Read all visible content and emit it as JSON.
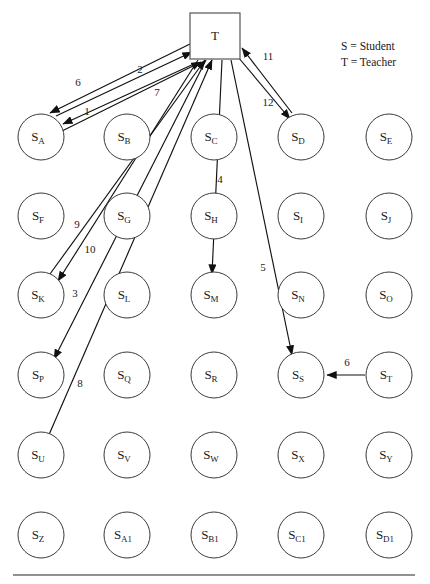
{
  "diagram": {
    "legend": [
      {
        "text": "S = Student"
      },
      {
        "text": "T = Teacher"
      }
    ],
    "teacher": {
      "id": "T",
      "label": "T",
      "x": 215,
      "y": 36,
      "w": 50,
      "h": 46
    },
    "geometry": {
      "radius": 23,
      "columns": [
        41,
        127,
        214,
        301,
        389
      ],
      "rows": [
        137,
        216,
        295,
        375,
        455,
        535
      ],
      "rule_y": 575,
      "rule_x1": 13,
      "rule_x2": 415
    },
    "students": [
      {
        "id": "S_A",
        "base": "S",
        "sub": "A",
        "col": 0,
        "row": 0
      },
      {
        "id": "S_B",
        "base": "S",
        "sub": "B",
        "col": 1,
        "row": 0
      },
      {
        "id": "S_C",
        "base": "S",
        "sub": "C",
        "col": 2,
        "row": 0
      },
      {
        "id": "S_D",
        "base": "S",
        "sub": "D",
        "col": 3,
        "row": 0
      },
      {
        "id": "S_E",
        "base": "S",
        "sub": "E",
        "col": 4,
        "row": 0
      },
      {
        "id": "S_F",
        "base": "S",
        "sub": "F",
        "col": 0,
        "row": 1
      },
      {
        "id": "S_G",
        "base": "S",
        "sub": "G",
        "col": 1,
        "row": 1
      },
      {
        "id": "S_H",
        "base": "S",
        "sub": "H",
        "col": 2,
        "row": 1
      },
      {
        "id": "S_I",
        "base": "S",
        "sub": "I",
        "col": 3,
        "row": 1
      },
      {
        "id": "S_J",
        "base": "S",
        "sub": "J",
        "col": 4,
        "row": 1
      },
      {
        "id": "S_K",
        "base": "S",
        "sub": "K",
        "col": 0,
        "row": 2
      },
      {
        "id": "S_L",
        "base": "S",
        "sub": "L",
        "col": 1,
        "row": 2
      },
      {
        "id": "S_M",
        "base": "S",
        "sub": "M",
        "col": 2,
        "row": 2
      },
      {
        "id": "S_N",
        "base": "S",
        "sub": "N",
        "col": 3,
        "row": 2
      },
      {
        "id": "S_O",
        "base": "S",
        "sub": "O",
        "col": 4,
        "row": 2
      },
      {
        "id": "S_P",
        "base": "S",
        "sub": "P",
        "col": 0,
        "row": 3
      },
      {
        "id": "S_Q",
        "base": "S",
        "sub": "Q",
        "col": 1,
        "row": 3
      },
      {
        "id": "S_R",
        "base": "S",
        "sub": "R",
        "col": 2,
        "row": 3
      },
      {
        "id": "S_S",
        "base": "S",
        "sub": "S",
        "col": 3,
        "row": 3
      },
      {
        "id": "S_T",
        "base": "S",
        "sub": "T",
        "col": 4,
        "row": 3
      },
      {
        "id": "S_U",
        "base": "S",
        "sub": "U",
        "col": 0,
        "row": 4
      },
      {
        "id": "S_V",
        "base": "S",
        "sub": "V",
        "col": 1,
        "row": 4
      },
      {
        "id": "S_W",
        "base": "S",
        "sub": "W",
        "col": 2,
        "row": 4
      },
      {
        "id": "S_X",
        "base": "S",
        "sub": "X",
        "col": 3,
        "row": 4
      },
      {
        "id": "S_Y",
        "base": "S",
        "sub": "Y",
        "col": 4,
        "row": 4
      },
      {
        "id": "S_Z",
        "base": "S",
        "sub": "Z",
        "col": 0,
        "row": 5
      },
      {
        "id": "S_A1",
        "base": "S",
        "sub": "A1",
        "col": 1,
        "row": 5
      },
      {
        "id": "S_B1",
        "base": "S",
        "sub": "B1",
        "col": 2,
        "row": 5
      },
      {
        "id": "S_C1",
        "base": "S",
        "sub": "C1",
        "col": 3,
        "row": 5
      },
      {
        "id": "S_D1",
        "base": "S",
        "sub": "D1",
        "col": 4,
        "row": 5
      }
    ],
    "edges": [
      {
        "label": "1",
        "from": "T",
        "to": "S_A",
        "x1": 196,
        "y1": 63,
        "x2": 63,
        "y2": 124,
        "lx": 87,
        "ly": 112
      },
      {
        "label": "2",
        "from": "S_A",
        "to": "T",
        "x1": 56,
        "y1": 116,
        "x2": 192,
        "y2": 52,
        "lx": 140,
        "ly": 70
      },
      {
        "label": "6",
        "from": "T",
        "to": "S_A",
        "x1": 190,
        "y1": 44,
        "x2": 50,
        "y2": 113,
        "lx": 78,
        "ly": 83
      },
      {
        "label": "7",
        "from": "S_A",
        "to": "T",
        "x1": 62,
        "y1": 131,
        "x2": 201,
        "y2": 62,
        "lx": 157,
        "ly": 93
      },
      {
        "label": "9",
        "from": "T",
        "to": "S_K",
        "x1": 198,
        "y1": 60,
        "x2": 58,
        "y2": 281,
        "lx": 77,
        "ly": 225
      },
      {
        "label": "10",
        "from": "S_K",
        "to": "T",
        "x1": 50,
        "y1": 274,
        "x2": 205,
        "y2": 60,
        "lx": 90,
        "ly": 250
      },
      {
        "label": "3",
        "from": "T",
        "to": "S_P",
        "x1": 206,
        "y1": 60,
        "x2": 54,
        "y2": 359,
        "lx": 75,
        "ly": 294
      },
      {
        "label": "8",
        "from": "S_U",
        "to": "T",
        "x1": 48,
        "y1": 437,
        "x2": 212,
        "y2": 60,
        "lx": 80,
        "ly": 384
      },
      {
        "label": "4",
        "from": "T",
        "to": "S_M",
        "x1": 222,
        "y1": 60,
        "x2": 212,
        "y2": 274,
        "lx": 220,
        "ly": 180
      },
      {
        "label": "5",
        "from": "T",
        "to": "S_S",
        "x1": 231,
        "y1": 60,
        "x2": 292,
        "y2": 355,
        "lx": 263,
        "ly": 268
      },
      {
        "label": "11",
        "from": "S_D",
        "to": "T",
        "x1": 292,
        "y1": 113,
        "x2": 242,
        "y2": 48,
        "lx": 268,
        "ly": 57
      },
      {
        "label": "12",
        "from": "T",
        "to": "S_D",
        "x1": 238,
        "y1": 57,
        "x2": 290,
        "y2": 119,
        "lx": 268,
        "ly": 103
      },
      {
        "label": "6",
        "from": "S_T",
        "to": "S_S",
        "x1": 365,
        "y1": 375,
        "x2": 327,
        "y2": 375,
        "lx": 347,
        "ly": 363
      }
    ]
  }
}
